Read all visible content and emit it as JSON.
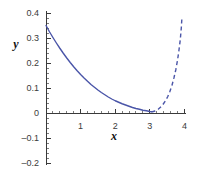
{
  "chart_data": {
    "type": "line",
    "title": "",
    "subtitle": "",
    "xlabel": "x",
    "ylabel": "y",
    "xlim": [
      0,
      4
    ],
    "ylim": [
      -0.2,
      0.4
    ],
    "grid": false,
    "legend": null,
    "x_ticks": [
      1,
      2,
      3,
      4
    ],
    "x_tick_labels": [
      "1",
      "2",
      "3",
      "4"
    ],
    "y_ticks": [
      -0.2,
      -0.1,
      0,
      0.1,
      0.2,
      0.3,
      0.4
    ],
    "y_tick_labels": [
      "-0.2",
      "-0.1",
      "0",
      "0.1",
      "0.2",
      "0.3",
      "0.4"
    ],
    "x_minor_tick_step": 0.2,
    "y_minor_tick_step": 0.02,
    "series": [
      {
        "name": "solid-branch",
        "style": "solid",
        "color": "#4a55a8",
        "x": [
          0.0,
          0.1,
          0.2,
          0.3,
          0.4,
          0.5,
          0.6,
          0.7,
          0.8,
          0.9,
          1.0,
          1.1,
          1.2,
          1.3,
          1.4,
          1.5,
          1.6,
          1.7,
          1.8,
          1.9,
          2.0,
          2.1,
          2.2,
          2.3,
          2.4,
          2.5,
          2.6,
          2.7,
          2.8,
          2.9,
          3.0,
          3.05
        ],
        "y": [
          0.35,
          0.325,
          0.302,
          0.28,
          0.259,
          0.239,
          0.22,
          0.202,
          0.185,
          0.169,
          0.154,
          0.14,
          0.127,
          0.114,
          0.103,
          0.092,
          0.082,
          0.073,
          0.064,
          0.056,
          0.049,
          0.043,
          0.037,
          0.032,
          0.027,
          0.022,
          0.018,
          0.015,
          0.011,
          0.009,
          0.006,
          0.005
        ]
      },
      {
        "name": "dashed-branch",
        "style": "dashed",
        "color": "#4a55a8",
        "dash_pattern": "4 3",
        "x": [
          3.05,
          3.15,
          3.25,
          3.35,
          3.45,
          3.52,
          3.58,
          3.64,
          3.7,
          3.75,
          3.8,
          3.84,
          3.88,
          3.91,
          3.93
        ],
        "y": [
          0.004,
          0.008,
          0.016,
          0.028,
          0.048,
          0.066,
          0.086,
          0.11,
          0.142,
          0.172,
          0.21,
          0.248,
          0.292,
          0.34,
          0.385
        ]
      }
    ]
  },
  "axis_labels": {
    "x": "x",
    "y": "y"
  },
  "colors": {
    "curve": "#4a55a8",
    "axis": "#3a3a3a",
    "tick_text": "#3b3b3b",
    "background": "#ffffff"
  }
}
